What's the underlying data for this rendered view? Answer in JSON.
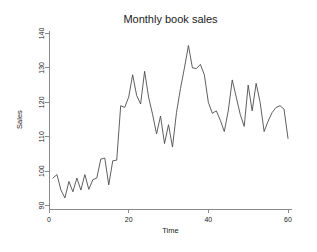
{
  "chart_data": {
    "type": "line",
    "title": "Monthly book sales",
    "xlabel": "Time",
    "ylabel": "Sales",
    "xlim": [
      0,
      61
    ],
    "ylim": [
      89,
      141
    ],
    "xticks": [
      0,
      20,
      40,
      60
    ],
    "xtick_labels": [
      "0",
      "20",
      "40",
      "60"
    ],
    "yticks": [
      90,
      100,
      110,
      120,
      130,
      140
    ],
    "ytick_labels": [
      "90",
      "100",
      "110",
      "120",
      "130",
      "140"
    ],
    "grid": false,
    "legend": "none",
    "line_color": "#4d4d4d",
    "axis_color": "#8a8a8a",
    "background_color": "#ffffff",
    "series": [
      {
        "name": "Sales",
        "x": [
          1,
          2,
          3,
          4,
          5,
          6,
          7,
          8,
          9,
          10,
          11,
          12,
          13,
          14,
          15,
          16,
          17,
          18,
          19,
          20,
          21,
          22,
          23,
          24,
          25,
          26,
          27,
          28,
          29,
          30,
          31,
          32,
          33,
          34,
          35,
          36,
          37,
          38,
          39,
          40,
          41,
          42,
          43,
          44,
          45,
          46,
          47,
          48,
          49,
          50,
          51,
          52,
          53,
          54,
          55,
          56,
          57,
          58,
          59,
          60
        ],
        "values": [
          98.0,
          99.0,
          94.5,
          92.2,
          97.0,
          94.0,
          98.0,
          94.5,
          99.0,
          94.7,
          97.5,
          98.0,
          103.5,
          103.8,
          96.0,
          103.0,
          103.2,
          119.0,
          118.5,
          121.5,
          128.0,
          122.0,
          119.5,
          129.0,
          121.5,
          116.5,
          110.8,
          116.0,
          108.0,
          113.5,
          107.0,
          117.0,
          124.0,
          130.0,
          136.5,
          130.0,
          129.8,
          131.0,
          128.0,
          120.0,
          116.8,
          117.5,
          114.8,
          111.5,
          117.5,
          126.5,
          121.5,
          116.5,
          113.0,
          125.0,
          117.5,
          125.5,
          120.0,
          111.5,
          114.5,
          117.0,
          118.5,
          119.0,
          118.0,
          109.5
        ]
      }
    ]
  }
}
